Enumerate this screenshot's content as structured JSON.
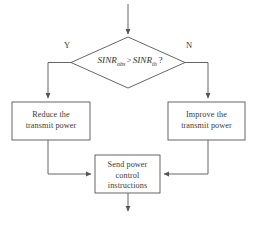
{
  "diagram": {
    "type": "flowchart",
    "stroke_color": "#555555",
    "text_color": "#3a3a3a",
    "background_color": "#ffffff",
    "decision": {
      "id": "sinr-comparison",
      "shape": "diamond",
      "text": "SINR_obs > SINR_th ?",
      "lhs_symbol": "SINR",
      "lhs_subscript": "obs",
      "operator": ">",
      "rhs_symbol": "SINR",
      "rhs_subscript": "th",
      "question_mark": "?"
    },
    "branches": [
      {
        "id": "branch-yes",
        "label": "Y",
        "side": "left",
        "target": "reduce-power"
      },
      {
        "id": "branch-no",
        "label": "N",
        "side": "right",
        "target": "improve-power"
      }
    ],
    "processes": [
      {
        "id": "reduce-power",
        "shape": "rectangle",
        "text": "Reduce the\ntransmit power"
      },
      {
        "id": "improve-power",
        "shape": "rectangle",
        "text": "Improve the\ntransmit power"
      },
      {
        "id": "send-instructions",
        "shape": "rectangle",
        "text": "Send power\ncontrol\ninstructions"
      }
    ],
    "connectors": [
      {
        "id": "entry-arrow",
        "from": "start",
        "to": "sinr-comparison",
        "direction": "down"
      },
      {
        "id": "yes-arrow",
        "from": "sinr-comparison",
        "to": "reduce-power",
        "direction": "left-down"
      },
      {
        "id": "no-arrow",
        "from": "sinr-comparison",
        "to": "improve-power",
        "direction": "right-down"
      },
      {
        "id": "reduce-to-send-arrow",
        "from": "reduce-power",
        "to": "send-instructions",
        "direction": "down-right"
      },
      {
        "id": "improve-to-send-arrow",
        "from": "improve-power",
        "to": "send-instructions",
        "direction": "down-left"
      },
      {
        "id": "exit-arrow",
        "from": "send-instructions",
        "to": "end",
        "direction": "down"
      }
    ]
  }
}
